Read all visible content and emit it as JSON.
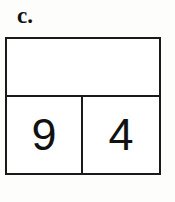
{
  "figure": {
    "part_label": "c.",
    "background_color": "#fdfdfb",
    "line_color": "#1a1a1a",
    "text_color": "#111111",
    "type": "place-value-chart",
    "rows": [
      {
        "name": "top-empty-row",
        "cells": [
          {
            "value": ""
          }
        ]
      },
      {
        "name": "digit-row",
        "cells": [
          {
            "name": "tens-cell",
            "value": "9"
          },
          {
            "name": "ones-cell",
            "value": "4"
          }
        ]
      }
    ]
  }
}
